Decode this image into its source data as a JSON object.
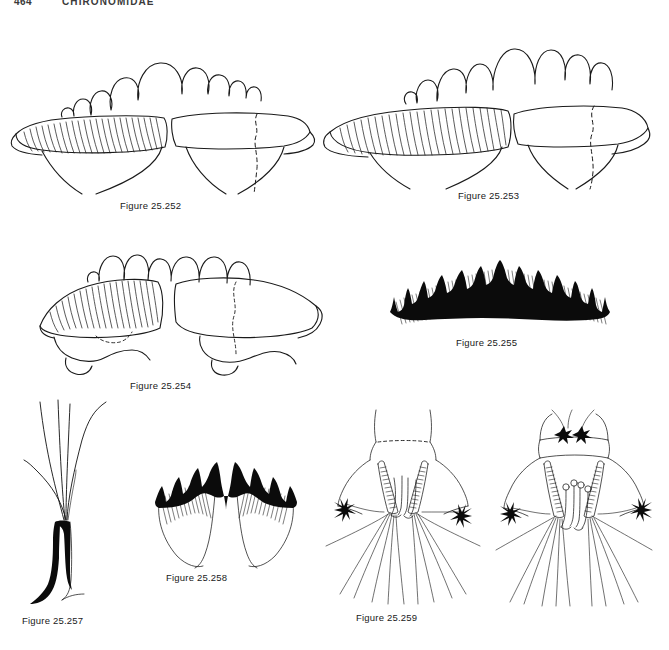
{
  "page": {
    "folio": "464",
    "running_head": "CHIRONOMIDAE",
    "background_color": "#ffffff",
    "ink_color": "#1a1a1a"
  },
  "figures": [
    {
      "id": "fig-25-252",
      "caption": "Figure 25.252",
      "subject": "larval mentum and mandible, ventral view",
      "description": "Broad scalloped labral/epipharyngeal arch above a pair of opposed lobes; left lobe densely striated with fine parallel hatching, right lobe plain with dashed internal outline."
    },
    {
      "id": "fig-25-253",
      "caption": "Figure 25.253",
      "subject": "larval mentum and mandible, ventral view",
      "description": "Similar to preceding but with deeper, more numerous pointed lobes on the arch; left element finely striated, right element with dashed suture."
    },
    {
      "id": "fig-25-254",
      "caption": "Figure 25.254",
      "subject": "larval mentum and mandible, ventral view",
      "description": "Low scalloped arch over two tilted striated plates; dashed internal sutures visible on both halves; basal flanges rounded."
    },
    {
      "id": "fig-25-255",
      "caption": "Figure 25.255",
      "subject": "larval mentum, ventral view",
      "description": "Strongly arched dark mentum bearing about fifteen solid black teeth, tallest at the midline and decreasing laterally, with a dense ventromental hair fringe beneath."
    },
    {
      "id": "fig-25-256",
      "caption": "Figure 25.256",
      "subject": "seta / papilla with apical setae",
      "description": "Stout solid black stalk expanded basally, bearing a spray of five long slender setae diverging from its apex."
    },
    {
      "id": "fig-25-257",
      "caption": "Figure 25.257",
      "subject": "larval mentum, ventral view",
      "description": "W-shaped mentum with two dark toothed lateral lobes separated by a deep median notch; pale ventromental plates curve below."
    },
    {
      "id": "fig-25-258",
      "caption": "Figure 25.258",
      "subject": "posterior abdominal segments, dorsal view",
      "description": "Terminal body segments with paired granulate procerci bearing long anal setae, two pairs of short anal tubules between them, and a star-shaped seta tuft on each lateral margin."
    },
    {
      "id": "fig-25-259",
      "caption": "Figure 25.259",
      "subject": "posterior abdominal segments, dorsal view",
      "description": "As preceding but with a pair of dark dorsal setal bases on the anterior segment and club-tipped anal tubules between the procerci."
    }
  ]
}
